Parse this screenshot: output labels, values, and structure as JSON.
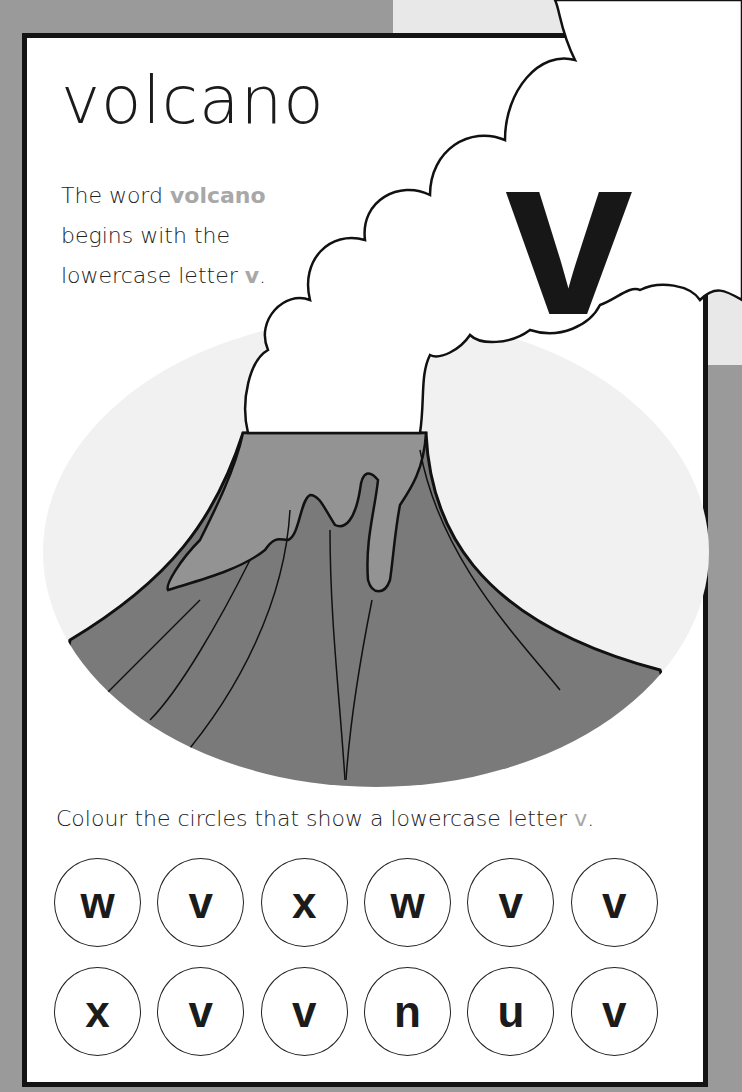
{
  "word": "volcano",
  "intro": {
    "line1_prefix": "The word ",
    "line1_highlight": "volcano",
    "line2": "begins with the",
    "line3_prefix": "lowercase letter ",
    "line3_highlight": "v",
    "line3_suffix": "."
  },
  "letter_panel": {
    "letter": "v"
  },
  "illustration": {
    "subject": "volcano-erupting-smoke"
  },
  "instruction": {
    "prefix": "Colour the circles that show a lowercase letter ",
    "highlight": "v",
    "suffix": "."
  },
  "circles": {
    "row1": [
      "w",
      "v",
      "x",
      "w",
      "v",
      "v"
    ],
    "row2": [
      "x",
      "v",
      "v",
      "n",
      "u",
      "v"
    ]
  },
  "colors": {
    "frame": "#9a9a9a",
    "border": "#141414",
    "highlight": "#a8a8a8",
    "panel": "#e8e8e8",
    "volcano_body": "#7a7a7a",
    "lava": "#939393"
  }
}
